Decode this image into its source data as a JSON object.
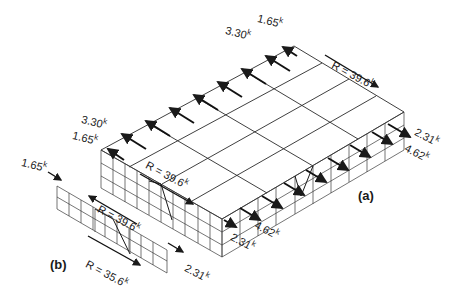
{
  "diagram": {
    "type": "isometric structural load diagram (roof diaphragm with shear walls)",
    "unit_suffix": "k",
    "labels": {
      "top_load_1": {
        "value": "1.65",
        "unit": "k"
      },
      "top_load_2": {
        "value": "3.30",
        "unit": "k"
      },
      "left_load_1": {
        "value": "3.30",
        "unit": "k"
      },
      "left_load_2": {
        "value": "1.65",
        "unit": "k"
      },
      "resultant_back": {
        "value": "R = 39.6",
        "unit": "k"
      },
      "resultant_front": {
        "value": "R = 39.6",
        "unit": "k"
      },
      "right_end_1": {
        "value": "2.31",
        "unit": "k"
      },
      "right_end_2": {
        "value": "4.62",
        "unit": "k"
      },
      "front_end_1": {
        "value": "4.62",
        "unit": "k"
      },
      "front_end_2": {
        "value": "2.31",
        "unit": "k"
      },
      "wall_b_load": {
        "value": "1.65",
        "unit": "k"
      },
      "wall_b_resultant_top": {
        "value": "R = 39.6",
        "unit": "k"
      },
      "wall_b_resultant_bottom": {
        "value": "R = 35.6",
        "unit": "k"
      },
      "wall_b_end": {
        "value": "2.31",
        "unit": "k"
      }
    },
    "captions": {
      "a": "(a)",
      "b": "(b)"
    }
  }
}
